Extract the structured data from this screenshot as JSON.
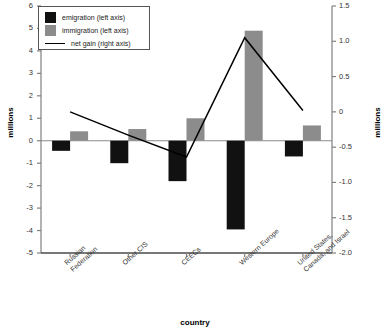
{
  "chart_data": {
    "type": "bar",
    "title": "",
    "xlabel": "country",
    "ylabel": "millions",
    "ylabel_right": "millions",
    "categories": [
      "Russian Federation",
      "Other CIS",
      "CEECs",
      "Western Europe",
      "United States, Canada, and Israel"
    ],
    "category_lines": [
      [
        "Russian",
        "Federation"
      ],
      [
        "Other CIS"
      ],
      [
        "CEECs"
      ],
      [
        "Western Europe"
      ],
      [
        "United States,",
        "Canada, and Israel"
      ]
    ],
    "series": [
      {
        "name": "emigration (left axis)",
        "axis": "left",
        "kind": "bar",
        "color": "#111111",
        "values": [
          -0.45,
          -1.0,
          -1.8,
          -3.95,
          -0.7
        ]
      },
      {
        "name": "immigration (left axis)",
        "axis": "left",
        "kind": "bar",
        "color": "#8c8c8c",
        "values": [
          0.42,
          0.52,
          1.0,
          4.9,
          0.68
        ]
      },
      {
        "name": "net gain (right axis)",
        "axis": "right",
        "kind": "line",
        "color": "#000000",
        "values": [
          0.0,
          -0.33,
          -0.64,
          1.05,
          0.02
        ]
      }
    ],
    "ylim_left": [
      -5,
      6
    ],
    "ylim_right": [
      -2.0,
      1.5
    ],
    "yticks_left": [
      "6",
      "5",
      "4",
      "3",
      "2",
      "1",
      "0",
      "-1",
      "-2",
      "-3",
      "-4",
      "-5"
    ],
    "yticks_right": [
      "1.5",
      "1.0",
      "0.5",
      "0",
      "-0.5",
      "-1.0",
      "-1.5",
      "-2.0"
    ],
    "grid": false,
    "legend_position": "top-left"
  },
  "legend": {
    "items": [
      {
        "label": "emigration (left axis)",
        "marker": "swatch",
        "color": "#111111"
      },
      {
        "label": "immigration (left axis)",
        "marker": "swatch",
        "color": "#8c8c8c"
      },
      {
        "label": "net gain (right axis)",
        "marker": "line",
        "color": "#000000"
      }
    ]
  }
}
